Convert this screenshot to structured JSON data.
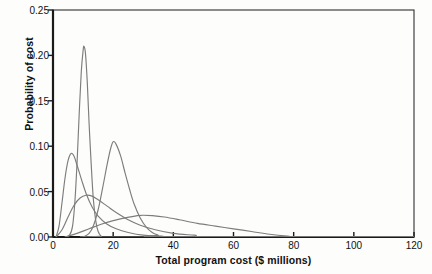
{
  "chart_data": {
    "type": "line",
    "title": "",
    "subtitle": "",
    "xlabel": "Total program cost ($ millions)",
    "ylabel": "Probability of cost",
    "xlim": [
      0,
      120
    ],
    "ylim": [
      0,
      0.25
    ],
    "xticks": [
      0,
      20,
      40,
      60,
      80,
      100,
      120
    ],
    "yticks": [
      "0.00",
      "0.05",
      "0.10",
      "0.15",
      "0.20",
      "0.25"
    ],
    "ytick_values": [
      0.0,
      0.05,
      0.1,
      0.15,
      0.2,
      0.25
    ],
    "grid": false,
    "legend": "none",
    "line_color": "#7d7d7d",
    "axis_color": "#1a1a1a",
    "background": "#fdfdfc",
    "annotations": [],
    "series": [
      {
        "name": "curve-1-narrow-tall",
        "description": "Very narrow tall peak near 10 reaching 0.21",
        "peak_x": 10.3,
        "peak_y": 0.21,
        "points": [
          [
            4.0,
            0.0
          ],
          [
            5.5,
            0.002
          ],
          [
            6.5,
            0.012
          ],
          [
            7.3,
            0.04
          ],
          [
            8.0,
            0.082
          ],
          [
            8.7,
            0.135
          ],
          [
            9.4,
            0.182
          ],
          [
            10.0,
            0.205
          ],
          [
            10.3,
            0.21
          ],
          [
            10.8,
            0.202
          ],
          [
            11.4,
            0.17
          ],
          [
            12.0,
            0.125
          ],
          [
            12.7,
            0.08
          ],
          [
            13.4,
            0.042
          ],
          [
            14.2,
            0.018
          ],
          [
            15.0,
            0.006
          ],
          [
            16.0,
            0.001
          ],
          [
            17.0,
            0.0
          ],
          [
            120.0,
            0.0
          ]
        ]
      },
      {
        "name": "curve-2-peak-20",
        "description": "Peak near 20 reaching 0.105 with tail to about 36",
        "peak_x": 20.0,
        "peak_y": 0.105,
        "points": [
          [
            10.0,
            0.0
          ],
          [
            12.0,
            0.004
          ],
          [
            13.5,
            0.013
          ],
          [
            15.0,
            0.03
          ],
          [
            16.5,
            0.054
          ],
          [
            18.0,
            0.08
          ],
          [
            19.2,
            0.098
          ],
          [
            20.0,
            0.105
          ],
          [
            21.0,
            0.102
          ],
          [
            22.5,
            0.089
          ],
          [
            24.0,
            0.07
          ],
          [
            25.5,
            0.052
          ],
          [
            27.0,
            0.036
          ],
          [
            29.0,
            0.021
          ],
          [
            31.0,
            0.011
          ],
          [
            33.0,
            0.005
          ],
          [
            35.0,
            0.002
          ],
          [
            37.0,
            0.0
          ],
          [
            120.0,
            0.0
          ]
        ]
      },
      {
        "name": "curve-3-peak-6",
        "description": "Peak near 6 reaching 0.092 with long right tail to about 45",
        "peak_x": 6.0,
        "peak_y": 0.092,
        "points": [
          [
            1.0,
            0.0
          ],
          [
            2.0,
            0.012
          ],
          [
            3.0,
            0.038
          ],
          [
            4.0,
            0.065
          ],
          [
            5.0,
            0.084
          ],
          [
            6.0,
            0.092
          ],
          [
            7.0,
            0.089
          ],
          [
            8.0,
            0.079
          ],
          [
            9.5,
            0.063
          ],
          [
            11.0,
            0.048
          ],
          [
            13.0,
            0.033
          ],
          [
            15.0,
            0.023
          ],
          [
            18.0,
            0.014
          ],
          [
            21.0,
            0.009
          ],
          [
            25.0,
            0.005
          ],
          [
            30.0,
            0.002
          ],
          [
            36.0,
            0.001
          ],
          [
            45.0,
            0.0
          ],
          [
            120.0,
            0.0
          ]
        ]
      },
      {
        "name": "curve-4-broad-peak-11",
        "description": "Broad low hump peaking near 11 at 0.046, tail to about 55",
        "peak_x": 11.0,
        "peak_y": 0.046,
        "points": [
          [
            1.0,
            0.0
          ],
          [
            3.0,
            0.008
          ],
          [
            5.0,
            0.022
          ],
          [
            7.0,
            0.035
          ],
          [
            9.0,
            0.043
          ],
          [
            11.0,
            0.046
          ],
          [
            13.0,
            0.045
          ],
          [
            15.0,
            0.041
          ],
          [
            18.0,
            0.034
          ],
          [
            21.0,
            0.027
          ],
          [
            25.0,
            0.019
          ],
          [
            29.0,
            0.013
          ],
          [
            34.0,
            0.008
          ],
          [
            40.0,
            0.004
          ],
          [
            47.0,
            0.002
          ],
          [
            55.0,
            0.0
          ],
          [
            120.0,
            0.0
          ]
        ]
      },
      {
        "name": "curve-5-broad-flat-long-tail",
        "description": "Very broad flat curve peaking near 30 at 0.024 with long tail to about 82",
        "peak_x": 30.0,
        "peak_y": 0.024,
        "points": [
          [
            4.0,
            0.0
          ],
          [
            8.0,
            0.004
          ],
          [
            12.0,
            0.009
          ],
          [
            16.0,
            0.014
          ],
          [
            20.0,
            0.018
          ],
          [
            24.0,
            0.021
          ],
          [
            28.0,
            0.0235
          ],
          [
            30.0,
            0.024
          ],
          [
            33.0,
            0.0235
          ],
          [
            37.0,
            0.022
          ],
          [
            42.0,
            0.019
          ],
          [
            48.0,
            0.015
          ],
          [
            54.0,
            0.012
          ],
          [
            60.0,
            0.009
          ],
          [
            66.0,
            0.006
          ],
          [
            72.0,
            0.003
          ],
          [
            78.0,
            0.001
          ],
          [
            83.0,
            0.0
          ],
          [
            120.0,
            0.0
          ]
        ]
      }
    ]
  }
}
